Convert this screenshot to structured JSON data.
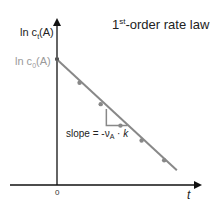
{
  "chart_data": {
    "type": "line",
    "title": "1st-order rate law",
    "title_main": "1",
    "title_sup": "st",
    "title_rest": "-order rate law",
    "xlabel": "t",
    "ylabel": "ln ct(A)",
    "ylabel_parts": {
      "prefix": "ln c",
      "sub": "t",
      "suffix": "(A)"
    },
    "y_intercept_label": {
      "prefix": "ln c",
      "sub": "0",
      "suffix": "(A)"
    },
    "x_ticks": [
      "0"
    ],
    "xlim": [
      0,
      1
    ],
    "ylim": [
      0,
      1
    ],
    "line": {
      "x": [
        0,
        0.85
      ],
      "y": [
        0.76,
        0.09
      ],
      "color": "#888888"
    },
    "points": {
      "x": [
        0.16,
        0.31,
        0.45,
        0.6,
        0.76
      ],
      "y": [
        0.62,
        0.49,
        0.36,
        0.27,
        0.15
      ],
      "color": "#888888"
    },
    "slope_triangle": {
      "x0": 0.35,
      "x1": 0.5,
      "y_top": 0.46,
      "y_bottom": 0.36,
      "color": "#888888"
    },
    "annotation": {
      "text_prefix": "slope = -ν",
      "sub": "A",
      "text_mid": " · ",
      "k": "k"
    },
    "grid": false,
    "legend": "none"
  }
}
